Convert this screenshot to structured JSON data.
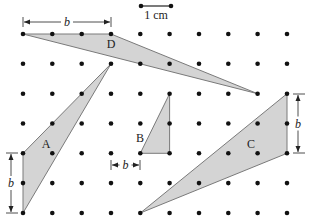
{
  "diagram": {
    "title": "",
    "scale_bar": {
      "label": "1 cm",
      "x1": 141,
      "x2": 171,
      "y": 6
    },
    "grid": {
      "cols": 10,
      "rows": 7,
      "x0": 23,
      "y0": 34,
      "dx": 29.33,
      "dy": 29.83,
      "dot_color": "#111111"
    },
    "colors": {
      "fill": "#d4d4d4",
      "stroke": "#7a7a7a",
      "dim": "#222222"
    },
    "triangles": [
      {
        "id": "D",
        "label": "D",
        "vertices": [
          [
            0,
            0
          ],
          [
            3,
            0
          ],
          [
            8,
            2
          ]
        ],
        "label_pos": [
          111,
          48
        ]
      },
      {
        "id": "A",
        "label": "A",
        "vertices": [
          [
            0,
            4
          ],
          [
            0,
            6
          ],
          [
            3,
            1
          ]
        ],
        "label_pos": [
          46,
          148
        ]
      },
      {
        "id": "B",
        "label": "B",
        "vertices": [
          [
            4,
            4
          ],
          [
            5,
            4
          ],
          [
            5,
            2
          ]
        ],
        "label_pos": [
          140,
          142
        ]
      },
      {
        "id": "C",
        "label": "C",
        "vertices": [
          [
            9,
            2
          ],
          [
            9,
            4
          ],
          [
            4,
            6
          ]
        ],
        "label_pos": [
          251,
          148
        ]
      }
    ],
    "base_markers": [
      {
        "for": "D",
        "label": "b",
        "orientation": "horizontal",
        "from": [
          23,
          22
        ],
        "to": [
          111,
          22
        ]
      },
      {
        "for": "A",
        "label": "b",
        "orientation": "vertical",
        "from": [
          11,
          153
        ],
        "to": [
          11,
          213
        ]
      },
      {
        "for": "B",
        "label": "b",
        "orientation": "horizontal",
        "from": [
          111,
          165
        ],
        "to": [
          140,
          165
        ]
      },
      {
        "for": "C",
        "label": "b",
        "orientation": "vertical",
        "from": [
          298,
          94
        ],
        "to": [
          298,
          153
        ]
      }
    ]
  }
}
